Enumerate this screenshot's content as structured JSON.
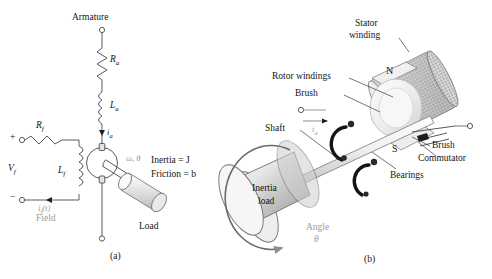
{
  "figure": {
    "type": "diagram",
    "panels": [
      {
        "id": "a",
        "caption": "(a)",
        "kind": "circuit-schematic"
      },
      {
        "id": "b",
        "caption": "(b)",
        "kind": "cutaway-illustration"
      }
    ]
  },
  "panel_a": {
    "caption": "(a)",
    "labels": {
      "armature": "Armature",
      "armature_resistance": "R",
      "armature_resistance_sub": "a",
      "armature_inductance": "L",
      "armature_inductance_sub": "a",
      "armature_current": "i",
      "armature_current_sub": "a",
      "field_resistance": "R",
      "field_resistance_sub": "f",
      "field_inductance": "L",
      "field_inductance_sub": "f",
      "field_voltage": "V",
      "field_voltage_sub": "f",
      "plus_terminal": "+",
      "minus_terminal": "−",
      "field_current": "i",
      "field_current_sub": "f",
      "field_current_arg": "(t)",
      "field_word": "Field",
      "omega_theta": "ω, θ",
      "inertia": "Inertia = J",
      "friction": "Friction = b",
      "load": "Load"
    }
  },
  "panel_b": {
    "caption": "(b)",
    "labels": {
      "stator_winding_line1": "Stator",
      "stator_winding_line2": "winding",
      "rotor_windings": "Rotor windings",
      "brush_left": "Brush",
      "brush_right": "Brush",
      "commutator": "Commutator",
      "bearings": "Bearings",
      "shaft": "Shaft",
      "inertia_load_line1": "Inertia",
      "inertia_load_line2": "load",
      "angle_line1": "Angle",
      "angle_line2": "θ",
      "pole_north": "N",
      "pole_south": "S",
      "armature_current": "i",
      "armature_current_sub": "a"
    }
  },
  "colors": {
    "background": "#ffffff",
    "ink": "#141414",
    "line": "#5a5a5a",
    "gray_text": "#9b9b9b",
    "metal_light": "#f2f2f2",
    "metal_mid": "#c9c9c9",
    "metal_dark": "#8f8f8f"
  }
}
